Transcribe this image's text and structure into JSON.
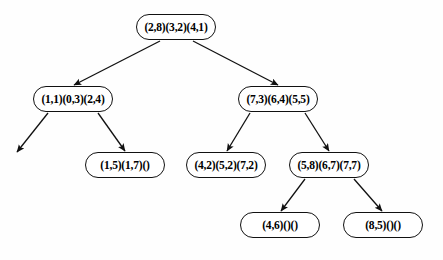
{
  "diagram": {
    "type": "tree",
    "title": "",
    "background_color": "#ffffff",
    "node_border_color": "#111111",
    "node_fill_color": "#ffffff",
    "edge_color": "#111111",
    "node_shape": "rounded-rectangle",
    "edge_style": "straight-arrow",
    "nodes": [
      {
        "id": "n0",
        "label": "(2,8)(3,2)(4,1)",
        "level": 0,
        "x": 136,
        "y": 14,
        "width": 80
      },
      {
        "id": "n1",
        "label": "(1,1)(0,3)(2,4)",
        "level": 1,
        "x": 33,
        "y": 86,
        "width": 80
      },
      {
        "id": "n2",
        "label": "(7,3)(6,4)(5,5)",
        "level": 1,
        "x": 238,
        "y": 86,
        "width": 80
      },
      {
        "id": "n3",
        "label": "(1,5)(1,7)()",
        "level": 2,
        "x": 85,
        "y": 152,
        "width": 80
      },
      {
        "id": "n4",
        "label": "(4,2)(5,2)(7,2)",
        "level": 2,
        "x": 186,
        "y": 152,
        "width": 80
      },
      {
        "id": "n5",
        "label": "(5,8)(6,7)(7,7)",
        "level": 2,
        "x": 289,
        "y": 152,
        "width": 80
      },
      {
        "id": "n6",
        "label": "(4,6)()()",
        "level": 3,
        "x": 240,
        "y": 212,
        "width": 80
      },
      {
        "id": "n7",
        "label": "(8,5)()()",
        "level": 3,
        "x": 343,
        "y": 212,
        "width": 80
      }
    ],
    "edges": [
      {
        "from": "n0",
        "to": "n1",
        "x1": 160,
        "y1": 41,
        "x2": 74,
        "y2": 85
      },
      {
        "from": "n0",
        "to": "n2",
        "x1": 193,
        "y1": 41,
        "x2": 278,
        "y2": 85
      },
      {
        "from": "n1",
        "to": "dangling",
        "x1": 48,
        "y1": 113,
        "x2": 17,
        "y2": 152,
        "dangling": true
      },
      {
        "from": "n1",
        "to": "n3",
        "x1": 98,
        "y1": 113,
        "x2": 125,
        "y2": 151
      },
      {
        "from": "n2",
        "to": "n4",
        "x1": 250,
        "y1": 113,
        "x2": 227,
        "y2": 151
      },
      {
        "from": "n2",
        "to": "n5",
        "x1": 305,
        "y1": 113,
        "x2": 329,
        "y2": 151
      },
      {
        "from": "n5",
        "to": "n6",
        "x1": 305,
        "y1": 179,
        "x2": 281,
        "y2": 211
      },
      {
        "from": "n5",
        "to": "n7",
        "x1": 354,
        "y1": 179,
        "x2": 382,
        "y2": 211
      }
    ]
  }
}
